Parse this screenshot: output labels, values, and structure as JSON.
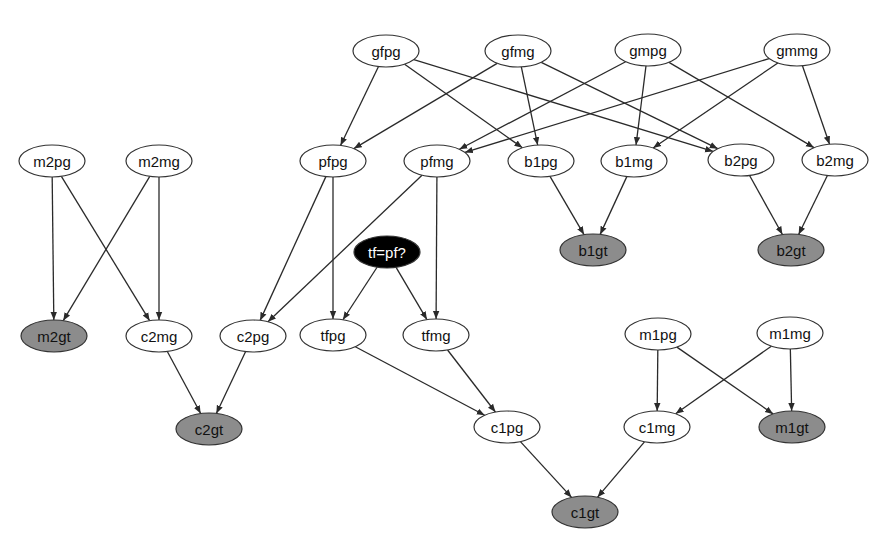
{
  "colors": {
    "background": "#ffffff",
    "node_plain_fill": "#ffffff",
    "node_observed_fill": "#8c8c8c",
    "node_query_fill": "#000000",
    "edge": "#2a2a2a"
  },
  "nodes": [
    {
      "id": "gfpg",
      "label": "gfpg",
      "x": 386,
      "y": 51,
      "type": "plain"
    },
    {
      "id": "gfmg",
      "label": "gfmg",
      "x": 518,
      "y": 51,
      "type": "plain"
    },
    {
      "id": "gmpg",
      "label": "gmpg",
      "x": 648,
      "y": 50,
      "type": "plain"
    },
    {
      "id": "gmmg",
      "label": "gmmg",
      "x": 797,
      "y": 50,
      "type": "plain"
    },
    {
      "id": "m2pg",
      "label": "m2pg",
      "x": 52,
      "y": 161,
      "type": "plain"
    },
    {
      "id": "m2mg",
      "label": "m2mg",
      "x": 159,
      "y": 161,
      "type": "plain"
    },
    {
      "id": "pfpg",
      "label": "pfpg",
      "x": 333,
      "y": 161,
      "type": "plain"
    },
    {
      "id": "pfmg",
      "label": "pfmg",
      "x": 437,
      "y": 161,
      "type": "plain"
    },
    {
      "id": "b1pg",
      "label": "b1pg",
      "x": 541,
      "y": 161,
      "type": "plain"
    },
    {
      "id": "b1mg",
      "label": "b1mg",
      "x": 634,
      "y": 161,
      "type": "plain"
    },
    {
      "id": "b2pg",
      "label": "b2pg",
      "x": 741,
      "y": 160,
      "type": "plain"
    },
    {
      "id": "b2mg",
      "label": "b2mg",
      "x": 835,
      "y": 160,
      "type": "plain"
    },
    {
      "id": "tfpf",
      "label": "tf=pf?",
      "x": 387,
      "y": 252,
      "type": "query"
    },
    {
      "id": "b1gt",
      "label": "b1gt",
      "x": 593,
      "y": 250,
      "type": "observed"
    },
    {
      "id": "b2gt",
      "label": "b2gt",
      "x": 791,
      "y": 250,
      "type": "observed"
    },
    {
      "id": "m2gt",
      "label": "m2gt",
      "x": 54,
      "y": 336,
      "type": "observed"
    },
    {
      "id": "c2mg",
      "label": "c2mg",
      "x": 159,
      "y": 336,
      "type": "plain"
    },
    {
      "id": "c2pg",
      "label": "c2pg",
      "x": 253,
      "y": 336,
      "type": "plain"
    },
    {
      "id": "tfpg",
      "label": "tfpg",
      "x": 333,
      "y": 335,
      "type": "plain"
    },
    {
      "id": "tfmg",
      "label": "tfmg",
      "x": 436,
      "y": 335,
      "type": "plain"
    },
    {
      "id": "m1pg",
      "label": "m1pg",
      "x": 658,
      "y": 334,
      "type": "plain"
    },
    {
      "id": "m1mg",
      "label": "m1mg",
      "x": 790,
      "y": 333,
      "type": "plain"
    },
    {
      "id": "c2gt",
      "label": "c2gt",
      "x": 209,
      "y": 429,
      "type": "observed"
    },
    {
      "id": "c1pg",
      "label": "c1pg",
      "x": 507,
      "y": 427,
      "type": "plain"
    },
    {
      "id": "c1mg",
      "label": "c1mg",
      "x": 657,
      "y": 427,
      "type": "plain"
    },
    {
      "id": "m1gt",
      "label": "m1gt",
      "x": 792,
      "y": 427,
      "type": "observed"
    },
    {
      "id": "c1gt",
      "label": "c1gt",
      "x": 585,
      "y": 512,
      "type": "observed"
    }
  ],
  "edges": [
    {
      "from": "gfpg",
      "to": "pfpg"
    },
    {
      "from": "gfpg",
      "to": "b1pg"
    },
    {
      "from": "gfpg",
      "to": "b2pg"
    },
    {
      "from": "gfmg",
      "to": "pfpg"
    },
    {
      "from": "gfmg",
      "to": "b1pg"
    },
    {
      "from": "gfmg",
      "to": "b2pg"
    },
    {
      "from": "gmpg",
      "to": "pfmg"
    },
    {
      "from": "gmpg",
      "to": "b1mg"
    },
    {
      "from": "gmpg",
      "to": "b2mg"
    },
    {
      "from": "gmmg",
      "to": "pfmg"
    },
    {
      "from": "gmmg",
      "to": "b1mg"
    },
    {
      "from": "gmmg",
      "to": "b2mg"
    },
    {
      "from": "m2pg",
      "to": "m2gt"
    },
    {
      "from": "m2pg",
      "to": "c2mg"
    },
    {
      "from": "m2mg",
      "to": "m2gt"
    },
    {
      "from": "m2mg",
      "to": "c2mg"
    },
    {
      "from": "pfpg",
      "to": "c2pg"
    },
    {
      "from": "pfpg",
      "to": "tfpg"
    },
    {
      "from": "pfmg",
      "to": "c2pg"
    },
    {
      "from": "pfmg",
      "to": "tfmg"
    },
    {
      "from": "tfpf",
      "to": "tfpg"
    },
    {
      "from": "tfpf",
      "to": "tfmg"
    },
    {
      "from": "b1pg",
      "to": "b1gt"
    },
    {
      "from": "b1mg",
      "to": "b1gt"
    },
    {
      "from": "b2pg",
      "to": "b2gt"
    },
    {
      "from": "b2mg",
      "to": "b2gt"
    },
    {
      "from": "c2mg",
      "to": "c2gt"
    },
    {
      "from": "c2pg",
      "to": "c2gt"
    },
    {
      "from": "tfpg",
      "to": "c1pg"
    },
    {
      "from": "tfmg",
      "to": "c1pg"
    },
    {
      "from": "m1pg",
      "to": "c1mg"
    },
    {
      "from": "m1pg",
      "to": "m1gt"
    },
    {
      "from": "m1mg",
      "to": "c1mg"
    },
    {
      "from": "m1mg",
      "to": "m1gt"
    },
    {
      "from": "c1pg",
      "to": "c1gt"
    },
    {
      "from": "c1mg",
      "to": "c1gt"
    }
  ]
}
